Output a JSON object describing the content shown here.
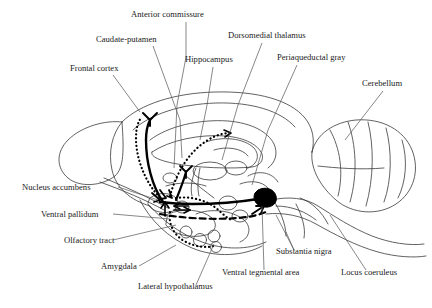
{
  "figure": {
    "background_color": "#ffffff",
    "outline_color": "#333333",
    "pathway_color": "#000000",
    "vta_fill_color": "#000000"
  },
  "labels": [
    {
      "id": "anterior-commissure",
      "text": "Anterior commissure",
      "x": 131,
      "y": 17,
      "anchor": "start"
    },
    {
      "id": "caudate-putamen",
      "text": "Caudate-putamen",
      "x": 96,
      "y": 42,
      "anchor": "start"
    },
    {
      "id": "dorsomedial-thalamus",
      "text": "Dorsomedial thalamus",
      "x": 228,
      "y": 38,
      "anchor": "start"
    },
    {
      "id": "frontal-cortex",
      "text": "Frontal cortex",
      "x": 70,
      "y": 71,
      "anchor": "start"
    },
    {
      "id": "hippocampus",
      "text": "Hippocampus",
      "x": 185,
      "y": 62,
      "anchor": "start"
    },
    {
      "id": "periaqueductal-gray",
      "text": "Periaqueductal gray",
      "x": 277,
      "y": 60,
      "anchor": "start"
    },
    {
      "id": "cerebellum",
      "text": "Cerebellum",
      "x": 362,
      "y": 86,
      "anchor": "start"
    },
    {
      "id": "nucleus-accumbens",
      "text": "Nucleus accumbens",
      "x": 22,
      "y": 190,
      "anchor": "start"
    },
    {
      "id": "ventral-pallidum",
      "text": "Ventral pallidum",
      "x": 41,
      "y": 217,
      "anchor": "start"
    },
    {
      "id": "olfactory-tract",
      "text": "Olfactory tract",
      "x": 64,
      "y": 243,
      "anchor": "start"
    },
    {
      "id": "amygdala",
      "text": "Amygdala",
      "x": 101,
      "y": 269,
      "anchor": "start"
    },
    {
      "id": "lateral-hypothalamus",
      "text": "Lateral hypothalamus",
      "x": 138,
      "y": 289,
      "anchor": "start"
    },
    {
      "id": "ventral-tegmental-area",
      "text": "Ventral tegmental area",
      "x": 222,
      "y": 275,
      "anchor": "start"
    },
    {
      "id": "substantia-nigra",
      "text": "Substantia nigra",
      "x": 276,
      "y": 254,
      "anchor": "start"
    },
    {
      "id": "locus-coeruleus",
      "text": "Locus coeruleus",
      "x": 341,
      "y": 275,
      "anchor": "start"
    }
  ],
  "leader_lines": [
    {
      "id": "leader-anterior-commissure",
      "path": "M 186 22 L 186 57 L 177 105 L 174 168"
    },
    {
      "id": "leader-caudate-putamen",
      "path": "M 153 46 L 180 120 L 182 158"
    },
    {
      "id": "leader-dorsomedial-thalamus",
      "path": "M 262 43 L 238 105 L 222 160"
    },
    {
      "id": "leader-frontal-cortex",
      "path": "M 113 75 L 140 112"
    },
    {
      "id": "leader-hippocampus",
      "path": "M 213 67 L 207 105 L 200 140"
    },
    {
      "id": "leader-periaqueductal-gray",
      "path": "M 297 65 L 268 130 L 252 185"
    },
    {
      "id": "leader-cerebellum",
      "path": "M 383 91 L 345 140"
    },
    {
      "id": "leader-nucleus-accumbens",
      "path": "M 118 187 L 158 200"
    },
    {
      "id": "leader-ventral-pallidum",
      "path": "M 113 214 L 170 219"
    },
    {
      "id": "leader-olfactory-tract",
      "path": "M 113 240 L 176 225"
    },
    {
      "id": "leader-amygdala",
      "path": "M 139 266 L 176 245"
    },
    {
      "id": "leader-lateral-hypothalamus",
      "path": "M 196 285 L 214 244"
    },
    {
      "id": "leader-ventral-tegmental-area",
      "path": "M 264 270 L 262 206"
    },
    {
      "id": "leader-substantia-nigra",
      "path": "M 294 250 L 286 232 M 294 250 L 276 215"
    },
    {
      "id": "leader-locus-coeruleus",
      "path": "M 366 270 L 330 215"
    }
  ],
  "structures": [
    {
      "id": "brain-outline",
      "name": "brain-outline"
    },
    {
      "id": "olfactory-bulb",
      "name": "olfactory-bulb"
    },
    {
      "id": "cerebellum-shape",
      "name": "cerebellum"
    },
    {
      "id": "brainstem",
      "name": "brainstem"
    },
    {
      "id": "corpus-callosum",
      "name": "corpus-callosum"
    },
    {
      "id": "hippocampus-shape",
      "name": "hippocampus"
    },
    {
      "id": "thalamus-shape",
      "name": "thalamus"
    },
    {
      "id": "vta-blob",
      "name": "ventral-tegmental-area-blob"
    }
  ],
  "pathways": [
    {
      "id": "mesocortical-dotted",
      "style": "dotted",
      "description": "accumbens to frontal cortex"
    },
    {
      "id": "mesolimbic-solid",
      "style": "solid",
      "description": "VTA to nucleus accumbens"
    },
    {
      "id": "amygdala-dotted",
      "style": "dotted",
      "description": "accumbens to amygdala"
    },
    {
      "id": "hippocampal-dotted",
      "style": "dotted",
      "description": "accumbens to hippocampus"
    },
    {
      "id": "pallidal-dashed",
      "style": "dashed",
      "description": "ventral pallidum projection"
    }
  ]
}
